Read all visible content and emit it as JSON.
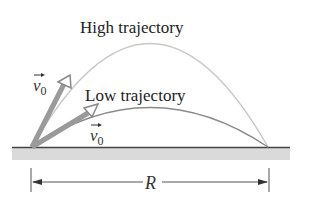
{
  "labels": {
    "high": "High trajectory",
    "low": "Low trajectory",
    "v_high": "v",
    "v_high_sub": "0",
    "v_low": "v",
    "v_low_sub": "0",
    "range": "R"
  },
  "colors": {
    "high_arc": "#c8c8c8",
    "low_arc": "#8a8a8a",
    "ground": "#d9d9d9",
    "ground_line": "#444444",
    "arrow": "#999999"
  }
}
